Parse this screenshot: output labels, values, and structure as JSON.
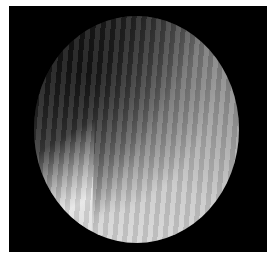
{
  "image": {
    "description": "Grayscale circular microscope/endoscope field of view on black square background with diagonal fringe stripes",
    "background_color": "#000000",
    "page_color": "#ffffff"
  },
  "caption": {
    "text": ""
  }
}
